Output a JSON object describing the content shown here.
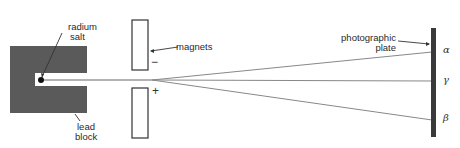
{
  "labels": {
    "radium_salt": [
      "radium",
      "salt"
    ],
    "lead_block": [
      "lead",
      "block"
    ],
    "magnets": "magnets",
    "photographic_plate": [
      "photographic",
      "plate"
    ],
    "minus": "−",
    "plus": "+"
  },
  "rays": [
    {
      "name": "alpha",
      "symbol": "α"
    },
    {
      "name": "gamma",
      "symbol": "γ"
    },
    {
      "name": "beta",
      "symbol": "β"
    }
  ],
  "colors": {
    "lead": "#5a5a5a",
    "plate": "#3a3a3a",
    "line": "#555555",
    "ray": "#888888"
  }
}
